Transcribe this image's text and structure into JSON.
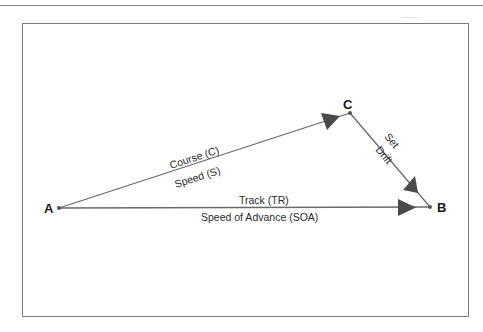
{
  "diagram": {
    "type": "vector-triangle",
    "points": {
      "A": {
        "label": "A"
      },
      "B": {
        "label": "B"
      },
      "C": {
        "label": "C"
      }
    },
    "vectors": [
      {
        "id": "course",
        "from": "A",
        "to": "C",
        "label_above": "Course (C)",
        "label_below": "Speed (S)"
      },
      {
        "id": "set-drift",
        "from": "C",
        "to": "B",
        "label_above": "Set",
        "label_below": "Drift"
      },
      {
        "id": "track",
        "from": "A",
        "to": "B",
        "label_above": "Track (TR)",
        "label_below": "Speed of Advance (SOA)"
      }
    ],
    "colors": {
      "line": "#6a6a6a",
      "arrowhead": "#4a4a4a",
      "frame": "#7a7a7a"
    }
  }
}
